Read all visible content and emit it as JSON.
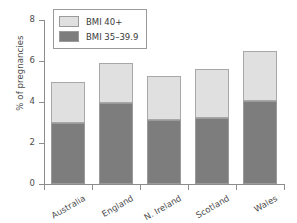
{
  "chart_data": {
    "type": "bar",
    "stacked": true,
    "title": "",
    "xlabel": "",
    "ylabel": "% of pregnancies",
    "ylim": [
      0,
      8
    ],
    "yticks": [
      0,
      2,
      4,
      6,
      8
    ],
    "ytick_labels": [
      "0",
      "2",
      "4",
      "6",
      "8"
    ],
    "grid": false,
    "legend_position": "upper-left-inside",
    "categories": [
      "Australia",
      "England",
      "N. Ireland",
      "Scotland",
      "Wales"
    ],
    "series": [
      {
        "name": "BMI 35–39.9",
        "color": "#7d7d7d",
        "values": [
          3.0,
          3.95,
          3.1,
          3.2,
          4.05
        ]
      },
      {
        "name": "BMI 40+",
        "color": "#e0e0e0",
        "values": [
          2.0,
          1.95,
          2.15,
          2.4,
          2.45
        ]
      }
    ],
    "totals": [
      5.0,
      5.9,
      5.25,
      5.6,
      6.5
    ]
  },
  "legend": {
    "entries": [
      {
        "label": "BMI 40+",
        "swatch": "#e0e0e0"
      },
      {
        "label": "BMI 35–39.9",
        "swatch": "#7d7d7d"
      }
    ]
  },
  "colors": {
    "bmi_40_plus": "#e0e0e0",
    "bmi_35_39": "#7d7d7d",
    "axis": "#8d8d8d",
    "text": "#4a4a4a",
    "background": "#ffffff"
  }
}
